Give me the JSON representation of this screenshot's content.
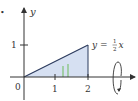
{
  "figure": {
    "marker": "•",
    "axes": {
      "y_label": "y",
      "x_ticks": [
        "0",
        "1",
        "2"
      ],
      "y_ticks": [
        "1"
      ]
    },
    "curve_label": {
      "prefix": "y = ",
      "frac_num": "1",
      "frac_den": "2",
      "suffix": "x"
    },
    "colors": {
      "region_fill": "#d6e0f2",
      "strip_stroke": "#6dbb5a",
      "axis": "#333333",
      "line": "#2b3a5c"
    },
    "rotation_axis": "x-axis"
  }
}
